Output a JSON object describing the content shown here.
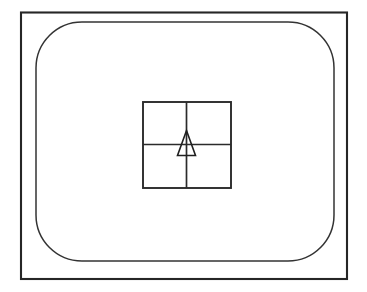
{
  "figure": {
    "title": "Television screen with centered crosshair and triangular marker",
    "background_color": "#ffffff",
    "line_color": "#1a1a1a",
    "canvas": {
      "width": 367,
      "height": 292
    }
  },
  "chart_data": {
    "type": "diagram",
    "title": "Television screen with centered crosshair and triangular marker",
    "shapes": [
      {
        "name": "outer-frame",
        "kind": "rectangle",
        "x": 21,
        "y": 12.5,
        "width": 326,
        "height": 266.5,
        "corner_radius": 0,
        "stroke_width": 2.1,
        "stroke": "#262626",
        "fill": "none"
      },
      {
        "name": "screen-bezel",
        "kind": "rounded-rectangle",
        "x": 36,
        "y": 22,
        "width": 298,
        "height": 239,
        "corner_radius": 46,
        "stroke_width": 1.5,
        "stroke": "#333333",
        "fill": "none"
      },
      {
        "name": "target-square",
        "kind": "rectangle",
        "x": 143,
        "y": 102,
        "width": 88,
        "height": 86,
        "corner_radius": 0,
        "stroke_width": 1.9,
        "stroke": "#2b2b2b",
        "fill": "none"
      },
      {
        "name": "crosshair-vertical",
        "kind": "line",
        "x1": 186.5,
        "y1": 102,
        "x2": 186.5,
        "y2": 188,
        "stroke_width": 1.7,
        "stroke": "#2b2b2b"
      },
      {
        "name": "crosshair-horizontal",
        "kind": "line",
        "x1": 143,
        "y1": 144.5,
        "x2": 231,
        "y2": 144.5,
        "stroke_width": 1.7,
        "stroke": "#2b2b2b"
      },
      {
        "name": "marker-triangle",
        "kind": "polygon",
        "points": "186.5,130.5 195.5,155.5 177.5,155.5",
        "apex": [
          186.5,
          130.5
        ],
        "base_left": [
          177.5,
          155.5
        ],
        "base_right": [
          195.5,
          155.5
        ],
        "stroke_width": 1.6,
        "stroke": "#1f1f1f",
        "fill": "none"
      }
    ],
    "center_point": [
      186.5,
      144.5
    ],
    "quadrants": [
      "top-left",
      "top-right",
      "bottom-left",
      "bottom-right"
    ],
    "xlabel": "",
    "ylabel": "",
    "grid": false,
    "legend": null
  }
}
